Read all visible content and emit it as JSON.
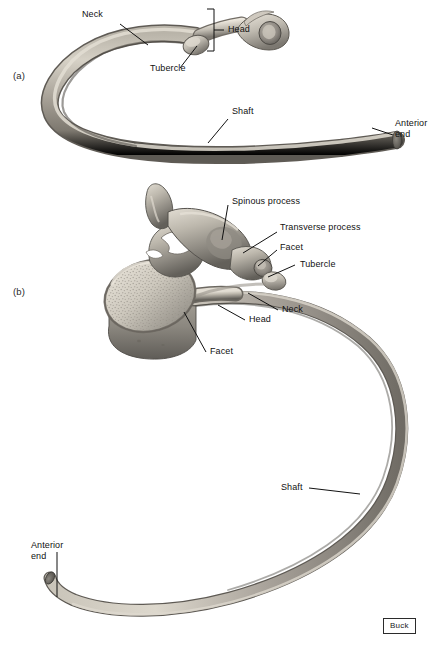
{
  "figure": {
    "background_color": "#ffffff",
    "credit": "Buck",
    "panels": [
      {
        "id": "a",
        "label": "(a)",
        "caption": "Isolated rib, superior view"
      },
      {
        "id": "b",
        "label": "(b)",
        "caption": "Rib articulated with thoracic vertebra"
      }
    ]
  },
  "panel_a": {
    "label": "(a)",
    "labels": {
      "neck": "Neck",
      "head": "Head",
      "tubercle": "Tubercle",
      "shaft": "Shaft",
      "anterior_end_line1": "Anterior",
      "anterior_end_line2": "end"
    }
  },
  "panel_b": {
    "label": "(b)",
    "labels": {
      "spinous_process": "Spinous process",
      "transverse_process": "Transverse process",
      "facet_upper": "Facet",
      "tubercle": "Tubercle",
      "neck": "Neck",
      "head": "Head",
      "facet_lower": "Facet",
      "shaft": "Shaft",
      "anterior_end_line1": "Anterior",
      "anterior_end_line2": "end"
    }
  },
  "colors": {
    "bone_light": "#d8d3c8",
    "bone_mid": "#a9a49a",
    "bone_dark": "#6e6a62",
    "bone_shadow": "#4c4944",
    "leader_line": "#111111",
    "text": "#111111",
    "background": "#ffffff"
  }
}
